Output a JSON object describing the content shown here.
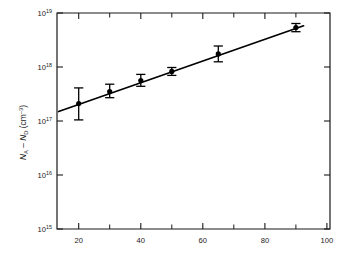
{
  "figure": {
    "background_color": "#ffffff",
    "foreground_color": "#1a1a1a",
    "data_color": "#000000"
  },
  "chart_data": {
    "type": "scatter",
    "title": "",
    "subtitle": "",
    "xlabel": "",
    "ylabel": "N_A - N_D (cm^-3)",
    "ylabel_parts": {
      "n1": "N",
      "sub1": "A",
      "minus": " – ",
      "n2": "N",
      "sub2": "D",
      "units_open": " (cm",
      "units_exp": "–3",
      "units_close": ")"
    },
    "xscale": "linear",
    "yscale": "log",
    "xlim": [
      13,
      101
    ],
    "ylim": [
      1000000000000000.0,
      1e+19
    ],
    "grid": false,
    "legend": null,
    "xticks": [
      20,
      40,
      60,
      80,
      100
    ],
    "xtick_labels": [
      "20",
      "40",
      "60",
      "80",
      "100"
    ],
    "xticks_minor": [
      30,
      50,
      70,
      90
    ],
    "yticks": [
      1000000000000000.0,
      1e+16,
      1e+17,
      1e+18,
      1e+19
    ],
    "ytick_labels": [
      "10¹⁵",
      "10¹⁶",
      "10¹⁷",
      "10¹⁸",
      "10¹⁹"
    ],
    "ytick_mantissa": "10",
    "ytick_exponents": [
      "15",
      "16",
      "17",
      "18",
      "19"
    ],
    "series": [
      {
        "name": "measured",
        "marker": "filled-circle",
        "x": [
          20,
          30,
          40,
          50,
          65,
          90
        ],
        "y": [
          2.1e+17,
          3.5e+17,
          5.6e+17,
          8.3e+17,
          1.75e+18,
          5.4e+18
        ],
        "yerr_low": [
          1.05e+17,
          2.7e+17,
          4.4e+17,
          7e+17,
          1.25e+18,
          4.5e+18
        ],
        "yerr_high": [
          4.1e+17,
          4.8e+17,
          7.3e+17,
          9.8e+17,
          2.45e+18,
          6.4e+18
        ]
      },
      {
        "name": "fit-line",
        "type": "line",
        "x": [
          13.5,
          92.5
        ],
        "y": [
          1.5e+17,
          5.8e+18
        ]
      }
    ]
  }
}
